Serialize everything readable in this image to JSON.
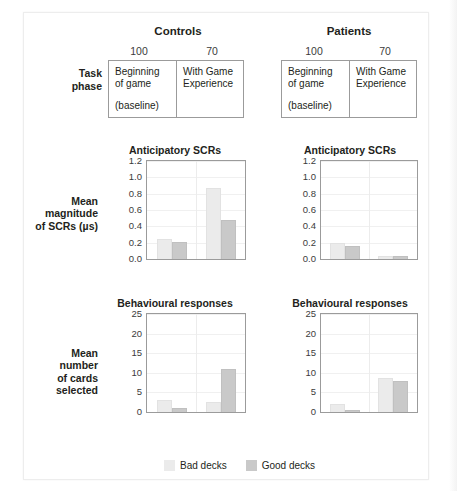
{
  "figure": {
    "groups": [
      {
        "name": "Controls",
        "cols": [
          "100",
          "70"
        ]
      },
      {
        "name": "Patients",
        "cols": [
          "100",
          "70"
        ]
      }
    ],
    "row_label": "Task\nphase",
    "row_label_l1": "Task",
    "row_label_l2": "phase",
    "phase_cells": [
      {
        "l1": "Beginning",
        "l2": "of game",
        "note": "(baseline)"
      },
      {
        "l1": "With Game",
        "l2": "Experience",
        "note": ""
      }
    ]
  },
  "legend": {
    "items": [
      {
        "label": "Bad decks",
        "color": "#ebebeb"
      },
      {
        "label": "Good decks",
        "color": "#c9c9c9"
      }
    ]
  },
  "axis_labels": {
    "scr": {
      "l1": "Mean",
      "l2": "magnitude",
      "l3": "of SCRs (µs)"
    },
    "behaviour": {
      "l1": "Mean",
      "l2": "number",
      "l3": "of cards",
      "l4": "selected"
    }
  },
  "chart_data": [
    {
      "id": "controls-scr",
      "type": "bar",
      "title": "Anticipatory SCRs",
      "group": "Controls",
      "xlabel": "",
      "ylabel": "Mean magnitude of SCRs (µs)",
      "ylim": [
        0,
        1.2
      ],
      "yticks": [
        "1.2",
        "1.0",
        "0.8",
        "0.6",
        "0.4",
        "0.2",
        "0.0"
      ],
      "ytick_values": [
        1.2,
        1.0,
        0.8,
        0.6,
        0.4,
        0.2,
        0.0
      ],
      "grid": true,
      "legend_position": "bottom",
      "categories": [
        "Beginning of game (baseline)",
        "With Game Experience"
      ],
      "series": [
        {
          "name": "Bad decks",
          "color": "#ebebeb",
          "values": [
            0.25,
            0.87
          ]
        },
        {
          "name": "Good decks",
          "color": "#c9c9c9",
          "values": [
            0.21,
            0.48
          ]
        }
      ]
    },
    {
      "id": "patients-scr",
      "type": "bar",
      "title": "Anticipatory SCRs",
      "group": "Patients",
      "xlabel": "",
      "ylabel": "Mean magnitude of SCRs (µs)",
      "ylim": [
        0,
        1.2
      ],
      "yticks": [
        "1.2",
        "1.0",
        "0.8",
        "0.6",
        "0.4",
        "0.2",
        "0.0"
      ],
      "ytick_values": [
        1.2,
        1.0,
        0.8,
        0.6,
        0.4,
        0.2,
        0.0
      ],
      "grid": true,
      "legend_position": "bottom",
      "categories": [
        "Beginning of game (baseline)",
        "With Game Experience"
      ],
      "series": [
        {
          "name": "Bad decks",
          "color": "#ebebeb",
          "values": [
            0.2,
            0.035
          ]
        },
        {
          "name": "Good decks",
          "color": "#c9c9c9",
          "values": [
            0.16,
            0.035
          ]
        }
      ]
    },
    {
      "id": "controls-behaviour",
      "type": "bar",
      "title": "Behavioural responses",
      "group": "Controls",
      "xlabel": "",
      "ylabel": "Mean number of cards selected",
      "ylim": [
        0,
        25
      ],
      "yticks": [
        "25",
        "20",
        "15",
        "10",
        "5",
        "0"
      ],
      "ytick_values": [
        25,
        20,
        15,
        10,
        5,
        0
      ],
      "grid": true,
      "legend_position": "bottom",
      "categories": [
        "Beginning of game (baseline)",
        "With Game Experience"
      ],
      "series": [
        {
          "name": "Bad decks",
          "color": "#ebebeb",
          "values": [
            3.0,
            2.5
          ]
        },
        {
          "name": "Good decks",
          "color": "#c9c9c9",
          "values": [
            1.0,
            11.0
          ]
        }
      ]
    },
    {
      "id": "patients-behaviour",
      "type": "bar",
      "title": "Behavioural responses",
      "group": "Patients",
      "xlabel": "",
      "ylabel": "Mean number of cards selected",
      "ylim": [
        0,
        25
      ],
      "yticks": [
        "25",
        "20",
        "15",
        "10",
        "5",
        "0"
      ],
      "ytick_values": [
        25,
        20,
        15,
        10,
        5,
        0
      ],
      "grid": true,
      "legend_position": "bottom",
      "categories": [
        "Beginning of game (baseline)",
        "With Game Experience"
      ],
      "series": [
        {
          "name": "Bad decks",
          "color": "#ebebeb",
          "values": [
            2.0,
            8.6
          ]
        },
        {
          "name": "Good decks",
          "color": "#c9c9c9",
          "values": [
            0.4,
            8.0
          ]
        }
      ]
    }
  ]
}
